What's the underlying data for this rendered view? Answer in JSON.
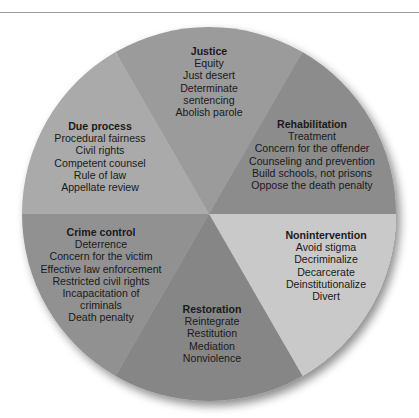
{
  "diagram": {
    "type": "pie",
    "slices": [
      {
        "id": "justice",
        "title": "Justice",
        "items": [
          "Equity",
          "Just desert",
          "Determinate",
          "sentencing",
          "Abolish parole"
        ],
        "color": "#9b9b9b"
      },
      {
        "id": "rehabilitation",
        "title": "Rehabilitation",
        "items": [
          "Treatment",
          "Concern for the offender",
          "Counseling and prevention",
          "Build schools, not prisons",
          "Oppose the death penalty"
        ],
        "color": "#8c8c8c"
      },
      {
        "id": "nonintervention",
        "title": "Nonintervention",
        "items": [
          "Avoid stigma",
          "Decriminalize",
          "Decarcerate",
          "Deinstitutionalize",
          "Divert"
        ],
        "color": "#c9c9c9"
      },
      {
        "id": "restoration",
        "title": "Restoration",
        "items": [
          "Reintegrate",
          "Restitution",
          "Mediation",
          "Nonviolence"
        ],
        "color": "#868686"
      },
      {
        "id": "crime-control",
        "title": "Crime control",
        "items": [
          "Deterrence",
          "Concern for the victim",
          "Effective law enforcement",
          "Restricted civil rights",
          "Incapacitation of",
          "criminals",
          "Death penalty"
        ],
        "color": "#919191"
      },
      {
        "id": "due-process",
        "title": "Due process",
        "items": [
          "Procedural fairness",
          "Civil rights",
          "Competent counsel",
          "Rule of law",
          "Appellate review"
        ],
        "color": "#aaaaaa"
      }
    ]
  }
}
